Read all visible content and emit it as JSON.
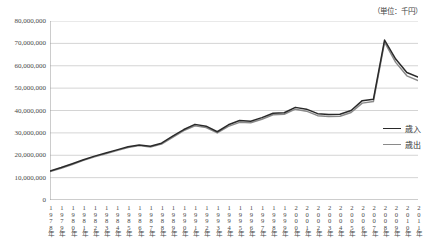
{
  "chart": {
    "title": "",
    "unit_label": "（単位：千円）"
  },
  "legend": {
    "position": "right",
    "entries": [
      {
        "label": "歳入",
        "color": "#2a2a2a"
      },
      {
        "label": "歳出",
        "color": "#8a8a8a"
      }
    ]
  },
  "chart_data": {
    "type": "line",
    "title": "",
    "xlabel": "",
    "ylabel": "",
    "unit": "千円",
    "grid": true,
    "legend_position": "right",
    "ylim": [
      0,
      80000000
    ],
    "yticks": [
      0,
      10000000,
      20000000,
      30000000,
      40000000,
      50000000,
      60000000,
      70000000,
      80000000
    ],
    "ytick_labels": [
      "0",
      "10,000,000",
      "20,000,000",
      "30,000,000",
      "40,000,000",
      "50,000,000",
      "60,000,000",
      "70,000,000",
      "80,000,000"
    ],
    "categories": [
      "1978年",
      "1979年",
      "1980年",
      "1981年",
      "1982年",
      "1983年",
      "1984年",
      "1985年",
      "1986年",
      "1987年",
      "1988年",
      "1989年",
      "1990年",
      "1991年",
      "1992年",
      "1993年",
      "1994年",
      "1995年",
      "1996年",
      "1997年",
      "1998年",
      "1999年",
      "2000年",
      "2001年",
      "2002年",
      "2003年",
      "2004年",
      "2005年",
      "2006年",
      "2007年",
      "2008年",
      "2009年",
      "2010年",
      "2011年"
    ],
    "series": [
      {
        "name": "歳入",
        "color": "#2a2a2a",
        "values": [
          13000000,
          14500000,
          16200000,
          18000000,
          19600000,
          21000000,
          22400000,
          23800000,
          24600000,
          24000000,
          25400000,
          28500000,
          31500000,
          33800000,
          33000000,
          30500000,
          33600000,
          35500000,
          35200000,
          36800000,
          38800000,
          39000000,
          41400000,
          40600000,
          38600000,
          38200000,
          38300000,
          40000000,
          44400000,
          45000000,
          71500000,
          63000000,
          57000000,
          55000000
        ]
      },
      {
        "name": "歳出",
        "color": "#8a8a8a",
        "values": [
          12700000,
          14200000,
          15900000,
          17700000,
          19300000,
          20700000,
          22100000,
          23500000,
          24300000,
          23700000,
          25000000,
          28000000,
          31000000,
          33200000,
          32400000,
          30000000,
          32900000,
          34700000,
          34500000,
          36100000,
          38100000,
          38300000,
          40600000,
          39700000,
          37700000,
          37300000,
          37400000,
          39100000,
          43300000,
          44000000,
          70500000,
          61500000,
          55500000,
          53400000
        ]
      }
    ]
  }
}
